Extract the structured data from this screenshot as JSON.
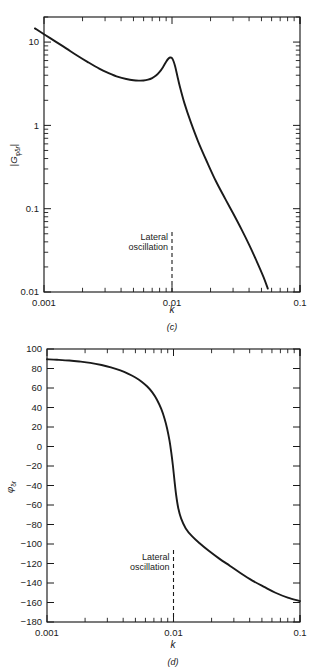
{
  "figure": {
    "panels": [
      {
        "id": "c",
        "caption": "(c)",
        "annotation": {
          "line1": "Lateral",
          "line2": "oscillation",
          "at_k": 0.01
        },
        "chart_data": {
          "type": "line",
          "title": "",
          "xlabel": "k",
          "ylabel": "|Gφδr|",
          "ylabel_parts": {
            "bar_left": "|",
            "g": "G",
            "sub1": "φ",
            "sub2": "δ",
            "sub3": "r",
            "bar_right": "|"
          },
          "xscale": "log",
          "yscale": "log",
          "xlim": [
            0.001,
            0.1
          ],
          "ylim": [
            0.01,
            20
          ],
          "xticks": [
            0.001,
            0.01,
            0.1
          ],
          "xticklabels": [
            "0.001",
            "0.01",
            "0.1"
          ],
          "yticks": [
            0.01,
            0.1,
            1,
            10
          ],
          "yticklabels": [
            "0.01",
            "0.1",
            "1",
            "10"
          ],
          "grid": false,
          "legend": "none",
          "series": [
            {
              "name": "|Gφδr| magnitude",
              "x": [
                0.00085,
                0.001,
                0.00125,
                0.0015,
                0.0018,
                0.0022,
                0.0027,
                0.0032,
                0.0038,
                0.0044,
                0.005,
                0.0055,
                0.006,
                0.0065,
                0.007,
                0.0075,
                0.008,
                0.0085,
                0.009,
                0.0094,
                0.0097,
                0.01,
                0.0103,
                0.0106,
                0.011,
                0.0115,
                0.0125,
                0.014,
                0.016,
                0.019,
                0.022,
                0.026,
                0.03,
                0.035,
                0.04,
                0.046,
                0.052,
                0.056
              ],
              "y": [
                14.6,
                12.4,
                10.0,
                8.35,
                6.95,
                5.75,
                4.8,
                4.25,
                3.82,
                3.6,
                3.48,
                3.45,
                3.46,
                3.54,
                3.7,
                3.96,
                4.38,
                5.0,
                5.82,
                6.35,
                6.52,
                6.4,
                5.85,
                5.05,
                3.95,
                2.95,
                1.85,
                1.1,
                0.64,
                0.35,
                0.215,
                0.132,
                0.088,
                0.056,
                0.037,
                0.0232,
                0.015,
                0.011
              ]
            }
          ]
        }
      },
      {
        "id": "d",
        "caption": "(d)",
        "annotation": {
          "line1": "Lateral",
          "line2": "oscillation",
          "at_k": 0.01
        },
        "chart_data": {
          "type": "line",
          "title": "",
          "xlabel": "k",
          "ylabel": "φδr",
          "ylabel_parts": {
            "phi": "φ",
            "sub1": "δ",
            "sub2": "r"
          },
          "xscale": "log",
          "yscale": "linear",
          "xlim": [
            0.001,
            0.1
          ],
          "ylim": [
            -180,
            100
          ],
          "xticks": [
            0.001,
            0.01,
            0.1
          ],
          "xticklabels": [
            "0.001",
            "0.01",
            "0.1"
          ],
          "yticks": [
            100,
            80,
            60,
            40,
            20,
            0,
            -20,
            -40,
            -60,
            -80,
            -100,
            -120,
            -140,
            -160,
            -180
          ],
          "yticklabels": [
            "100",
            "80",
            "60",
            "40",
            "20",
            "0",
            "−20",
            "−40",
            "−60",
            "−80",
            "−100",
            "−120",
            "−140",
            "−160",
            "−180"
          ],
          "grid": false,
          "legend": "none",
          "series": [
            {
              "name": "φδr phase (deg)",
              "x": [
                0.001,
                0.0012,
                0.0015,
                0.0018,
                0.0022,
                0.0027,
                0.0032,
                0.0038,
                0.0044,
                0.005,
                0.0056,
                0.0062,
                0.0068,
                0.0074,
                0.008,
                0.0085,
                0.0089,
                0.0093,
                0.0096,
                0.0099,
                0.0102,
                0.0105,
                0.0109,
                0.0115,
                0.0125,
                0.014,
                0.016,
                0.019,
                0.023,
                0.028,
                0.034,
                0.042,
                0.052,
                0.064,
                0.08,
                0.1
              ],
              "y": [
                89.5,
                89.0,
                88.2,
                87.2,
                85.8,
                83.6,
                81.2,
                78.0,
                74.5,
                70.8,
                66.5,
                61.5,
                55.5,
                48.0,
                38.5,
                28.5,
                18.5,
                6.0,
                -6.0,
                -20.0,
                -36.0,
                -50.0,
                -63.0,
                -74.0,
                -84.0,
                -92.0,
                -99.0,
                -107.0,
                -115.0,
                -122.5,
                -130.0,
                -137.5,
                -144.0,
                -150.0,
                -155.0,
                -158.5
              ]
            }
          ]
        }
      }
    ]
  }
}
